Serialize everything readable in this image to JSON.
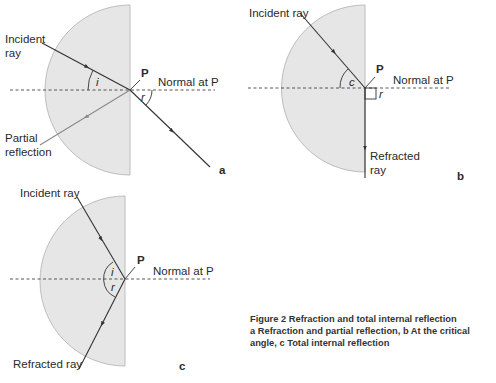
{
  "figure": {
    "caption_title": "Figure 2  Refraction and total internal reflection",
    "caption_line2": "a Refraction and partial reflection, b At the critical",
    "caption_line3": "angle, c Total internal reflection"
  },
  "colors": {
    "block_fill": "#e6e6e6",
    "block_stroke": "#bdbdbd",
    "ray": "#333333",
    "reflected_ray": "#8a8a8a",
    "text": "#2a2a2a"
  },
  "panel_a": {
    "label": "a",
    "incident_label_1": "Incident",
    "incident_label_2": "ray",
    "point_label": "P",
    "normal_label": "Normal at P",
    "angle_i": "i",
    "angle_r": "r",
    "reflection_label_1": "Partial",
    "reflection_label_2": "reflection"
  },
  "panel_b": {
    "label": "b",
    "incident_label": "Incident ray",
    "point_label": "P",
    "normal_label": "Normal at P",
    "angle_c": "c",
    "angle_r": "r",
    "refracted_label_1": "Refracted",
    "refracted_label_2": "ray"
  },
  "panel_c": {
    "label": "c",
    "incident_label": "Incident ray",
    "point_label": "P",
    "normal_label": "Normal at P",
    "angle_i": "i",
    "angle_r": "r",
    "refracted_label": "Refracted ray"
  }
}
